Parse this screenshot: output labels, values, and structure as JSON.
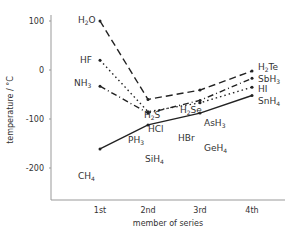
{
  "chart_data": {
    "type": "line",
    "title": "",
    "xlabel": "member of series",
    "ylabel": "temperature / °C",
    "categories": [
      "1st",
      "2nd",
      "3rd",
      "4th"
    ],
    "yticks": [
      100,
      0,
      -100,
      -200
    ],
    "ylim": [
      -260,
      110
    ],
    "grid": false,
    "series": [
      {
        "name": "Group 14",
        "style": "solid",
        "labels": [
          "CH4",
          "SiH4",
          "GeH4",
          "SnH4"
        ],
        "values": [
          -161,
          -112,
          -88,
          -52
        ]
      },
      {
        "name": "Group 15",
        "style": "dash-dot",
        "labels": [
          "NH3",
          "PH3",
          "AsH3",
          "SbH3"
        ],
        "values": [
          -33,
          -88,
          -62,
          -17
        ]
      },
      {
        "name": "Group 16",
        "style": "dashed",
        "labels": [
          "H2O",
          "H2S",
          "H2Se",
          "H2Te"
        ],
        "values": [
          100,
          -60,
          -41,
          -2
        ]
      },
      {
        "name": "Group 17",
        "style": "dotted",
        "labels": [
          "HF",
          "HCl",
          "HBr",
          "HI"
        ],
        "values": [
          20,
          -85,
          -67,
          -35
        ]
      }
    ]
  },
  "axis": {
    "xlabel": "member of series",
    "ylabel": "temperature / °C",
    "xticks": [
      "1st",
      "2nd",
      "3rd",
      "4th"
    ],
    "yticks": [
      "100",
      "0",
      "-100",
      "-200"
    ]
  }
}
